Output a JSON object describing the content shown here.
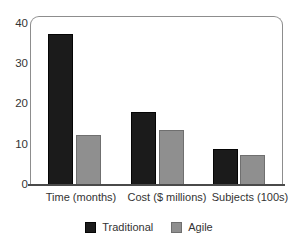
{
  "chart_data": {
    "type": "bar",
    "title": "",
    "subtitle": "",
    "xlabel": "",
    "ylabel": "",
    "categories": [
      "Time (months)",
      "Cost ($ millions)",
      "Subjects (100s)"
    ],
    "series": [
      {
        "name": "Traditional",
        "color": "#1b1b1b",
        "values": [
          38.5,
          18.5,
          9.2
        ]
      },
      {
        "name": "Agile",
        "color": "#8f8f8f",
        "values": [
          12.6,
          14.0,
          7.6
        ]
      }
    ],
    "ylim": [
      0,
      43
    ],
    "yticks": [
      0,
      10,
      20,
      30,
      40
    ],
    "ytick_labels": [
      "0",
      "10",
      "20",
      "30",
      "40"
    ],
    "grid": false,
    "legend_position": "bottom"
  },
  "axes": {
    "y_tick_labels": [
      "40",
      "30",
      "20",
      "10",
      "0"
    ]
  },
  "legend": {
    "items": [
      {
        "label": "Traditional",
        "color": "#1b1b1b"
      },
      {
        "label": "Agile",
        "color": "#8f8f8f"
      }
    ]
  },
  "colors": {
    "traditional": "#1b1b1b",
    "agile": "#8f8f8f",
    "axis": "#4a4a4a",
    "frame": "#8d8d8d",
    "text": "#333333",
    "background": "#ffffff"
  }
}
